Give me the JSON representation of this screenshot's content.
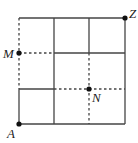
{
  "diagram": {
    "type": "grid-path",
    "grid": {
      "rows": 3,
      "cols": 3
    },
    "colors": {
      "line": "#444444",
      "point": "#111111",
      "background": "#ffffff"
    },
    "points": {
      "A": {
        "label": "A"
      },
      "M": {
        "label": "M"
      },
      "N": {
        "label": "N"
      },
      "Z": {
        "label": "Z"
      }
    }
  }
}
